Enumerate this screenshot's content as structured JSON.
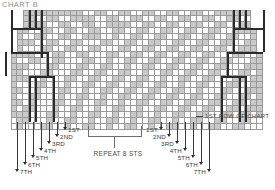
{
  "title": "CHART B",
  "callouts": {
    "first_row": "1ST ROW OF CHART",
    "repeat": "REPEAT 8 STS"
  },
  "row_labels_left": [
    "1ST",
    "2ND",
    "3RD",
    "4TH",
    "5TH",
    "6TH",
    "7TH"
  ],
  "row_labels_right": [
    "1ST",
    "2ND",
    "3RD",
    "4TH",
    "5TH",
    "6TH",
    "7TH"
  ],
  "colors": {
    "grid_line": "#9a9a9a",
    "shaded_cell": "#c9c9c9",
    "empty_cell": "#ffffff",
    "heavy_outline": "#2b2b2b",
    "title": "#8d8d8d",
    "label": "#3a3a3a"
  },
  "chart_data": {
    "type": "heatmap",
    "title": "CHART B",
    "xlabel": "",
    "ylabel": "",
    "cell_size_px": 6,
    "columns": 42,
    "rows": 20,
    "legend": [
      {
        "key": "shaded",
        "color": "#c9c9c9",
        "meaning": "patterned stitch"
      },
      {
        "key": "empty",
        "color": "#ffffff",
        "meaning": "plain stitch"
      }
    ],
    "annotations": [
      {
        "text": "1ST ROW OF CHART",
        "position": "right-bottom"
      },
      {
        "text": "REPEAT 8 STS",
        "position": "bottom-center"
      }
    ],
    "row_extents": [
      {
        "row": 0,
        "start": 2,
        "end": 40
      },
      {
        "row": 1,
        "start": 2,
        "end": 40
      },
      {
        "row": 2,
        "start": 2,
        "end": 40
      },
      {
        "row": 3,
        "start": 1,
        "end": 41
      },
      {
        "row": 4,
        "start": 1,
        "end": 41
      },
      {
        "row": 5,
        "start": 1,
        "end": 41
      },
      {
        "row": 6,
        "start": 1,
        "end": 41
      },
      {
        "row": 7,
        "start": 0,
        "end": 42
      },
      {
        "row": 8,
        "start": 0,
        "end": 42
      },
      {
        "row": 9,
        "start": 0,
        "end": 42
      },
      {
        "row": 10,
        "start": 0,
        "end": 42
      },
      {
        "row": 11,
        "start": 0,
        "end": 42
      },
      {
        "row": 12,
        "start": 0,
        "end": 42
      },
      {
        "row": 13,
        "start": 0,
        "end": 42
      },
      {
        "row": 14,
        "start": 0,
        "end": 42
      },
      {
        "row": 15,
        "start": 0,
        "end": 42
      },
      {
        "row": 16,
        "start": 0,
        "end": 42
      },
      {
        "row": 17,
        "start": 0,
        "end": 42
      },
      {
        "row": 18,
        "start": 0,
        "end": 42
      },
      {
        "row": 19,
        "start": 0,
        "end": 42
      }
    ],
    "shaded_cells": [
      {
        "row": 0,
        "cols": [
          2,
          3,
          4,
          5,
          6,
          7,
          8,
          9,
          10,
          11,
          14,
          15,
          18,
          19,
          22,
          23,
          26,
          27,
          30,
          31,
          34,
          35,
          36,
          37,
          38,
          39
        ]
      },
      {
        "row": 1,
        "cols": [
          2,
          3,
          6,
          7,
          10,
          11,
          12,
          13,
          16,
          17,
          20,
          21,
          24,
          25,
          28,
          29,
          32,
          33,
          36,
          37
        ]
      },
      {
        "row": 2,
        "cols": [
          2,
          3,
          4,
          5,
          8,
          9,
          12,
          13,
          16,
          17,
          18,
          19,
          22,
          23,
          26,
          27,
          30,
          31,
          34,
          35,
          38,
          39
        ]
      },
      {
        "row": 3,
        "cols": [
          1,
          2,
          5,
          6,
          9,
          10,
          13,
          14,
          17,
          18,
          21,
          22,
          25,
          26,
          29,
          30,
          33,
          34,
          37,
          38,
          39,
          40
        ]
      },
      {
        "row": 4,
        "cols": [
          1,
          4,
          5,
          8,
          9,
          12,
          13,
          14,
          17,
          20,
          21,
          24,
          25,
          28,
          29,
          32,
          33,
          36,
          37,
          40
        ]
      },
      {
        "row": 5,
        "cols": [
          1,
          2,
          3,
          6,
          7,
          10,
          11,
          15,
          16,
          19,
          20,
          23,
          24,
          27,
          28,
          31,
          32,
          35,
          36,
          39,
          40
        ]
      },
      {
        "row": 6,
        "cols": [
          1,
          5,
          6,
          9,
          10,
          13,
          14,
          18,
          19,
          22,
          23,
          26,
          27,
          30,
          31,
          34,
          35,
          38,
          39,
          40
        ]
      },
      {
        "row": 7,
        "cols": [
          0,
          1,
          2,
          3,
          7,
          8,
          11,
          12,
          16,
          17,
          20,
          21,
          24,
          25,
          28,
          29,
          32,
          33,
          37,
          38,
          41
        ]
      },
      {
        "row": 8,
        "cols": [
          0,
          3,
          4,
          7,
          8,
          12,
          13,
          16,
          19,
          20,
          23,
          24,
          27,
          28,
          31,
          32,
          35,
          36,
          40,
          41
        ]
      },
      {
        "row": 9,
        "cols": [
          0,
          1,
          2,
          6,
          7,
          11,
          12,
          15,
          16,
          19,
          22,
          23,
          26,
          27,
          30,
          31,
          34,
          35,
          39,
          40,
          41
        ]
      },
      {
        "row": 10,
        "cols": [
          0,
          1,
          5,
          6,
          10,
          11,
          14,
          15,
          18,
          19,
          22,
          25,
          26,
          29,
          30,
          33,
          34,
          38,
          39,
          41
        ]
      },
      {
        "row": 11,
        "cols": [
          0,
          1,
          2,
          5,
          9,
          10,
          13,
          14,
          17,
          18,
          21,
          22,
          25,
          28,
          29,
          32,
          33,
          37,
          38,
          40,
          41
        ]
      },
      {
        "row": 12,
        "cols": [
          0,
          4,
          5,
          9,
          12,
          13,
          16,
          17,
          20,
          21,
          24,
          25,
          28,
          31,
          32,
          36,
          37,
          40,
          41
        ]
      },
      {
        "row": 13,
        "cols": [
          0,
          1,
          4,
          8,
          9,
          12,
          15,
          16,
          19,
          20,
          23,
          24,
          27,
          28,
          31,
          35,
          36,
          39,
          40,
          41
        ]
      },
      {
        "row": 14,
        "cols": [
          0,
          3,
          4,
          8,
          11,
          12,
          15,
          18,
          19,
          22,
          23,
          26,
          27,
          30,
          31,
          34,
          35,
          38,
          39,
          41
        ]
      },
      {
        "row": 15,
        "cols": [
          0,
          1,
          3,
          7,
          8,
          11,
          14,
          15,
          18,
          21,
          22,
          25,
          26,
          29,
          30,
          33,
          34,
          37,
          38,
          40,
          41
        ]
      },
      {
        "row": 16,
        "cols": [
          0,
          2,
          3,
          7,
          10,
          11,
          14,
          17,
          18,
          21,
          24,
          25,
          28,
          29,
          32,
          33,
          36,
          37,
          39,
          40,
          41
        ]
      },
      {
        "row": 17,
        "cols": [
          0,
          1,
          2,
          6,
          7,
          10,
          13,
          14,
          17,
          20,
          21,
          24,
          27,
          28,
          31,
          32,
          35,
          36,
          38,
          39,
          41
        ]
      },
      {
        "row": 18,
        "cols": [
          1,
          2,
          6,
          9,
          10,
          13,
          16,
          17,
          20,
          23,
          24,
          27,
          30,
          31,
          34,
          35,
          38,
          39
        ]
      },
      {
        "row": 19,
        "cols": [
          1,
          5,
          6,
          9,
          12,
          13,
          16,
          19,
          20,
          23,
          26,
          27,
          30,
          33,
          34,
          37,
          38
        ]
      }
    ]
  },
  "grid_geometry": {
    "origin_x": 11,
    "origin_y": 10,
    "cell": 6,
    "rows": 20,
    "cols": 42
  },
  "heavy_outline_segments": [
    {
      "type": "v",
      "x": 11,
      "y": 10,
      "len": 18
    },
    {
      "type": "v",
      "x": 29,
      "y": 10,
      "len": 18
    },
    {
      "type": "v",
      "x": 35,
      "y": 10,
      "len": 18
    },
    {
      "type": "v",
      "x": 41,
      "y": 10,
      "len": 18
    },
    {
      "type": "h",
      "x": 11,
      "y": 28,
      "len": 30
    },
    {
      "type": "v",
      "x": 11,
      "y": 28,
      "len": 24
    },
    {
      "type": "v",
      "x": 41,
      "y": 28,
      "len": 24
    },
    {
      "type": "h",
      "x": 11,
      "y": 52,
      "len": 36
    },
    {
      "type": "v",
      "x": 41,
      "y": 52,
      "len": 6
    },
    {
      "type": "v",
      "x": 47,
      "y": 52,
      "len": 24
    },
    {
      "type": "v",
      "x": 5,
      "y": 52,
      "len": 24
    },
    {
      "type": "h",
      "x": 29,
      "y": 76,
      "len": 24
    },
    {
      "type": "v",
      "x": 53,
      "y": 76,
      "len": 46
    },
    {
      "type": "v",
      "x": 29,
      "y": 76,
      "len": 46
    },
    {
      "type": "v",
      "x": 35,
      "y": 76,
      "len": 46
    },
    {
      "type": "v",
      "x": 233,
      "y": 10,
      "len": 18
    },
    {
      "type": "v",
      "x": 239,
      "y": 10,
      "len": 18
    },
    {
      "type": "v",
      "x": 245,
      "y": 10,
      "len": 18
    },
    {
      "type": "v",
      "x": 263,
      "y": 10,
      "len": 18
    },
    {
      "type": "h",
      "x": 233,
      "y": 28,
      "len": 30
    },
    {
      "type": "v",
      "x": 233,
      "y": 28,
      "len": 24
    },
    {
      "type": "v",
      "x": 263,
      "y": 28,
      "len": 24
    },
    {
      "type": "h",
      "x": 227,
      "y": 52,
      "len": 36
    },
    {
      "type": "v",
      "x": 227,
      "y": 52,
      "len": 24
    },
    {
      "type": "h",
      "x": 221,
      "y": 76,
      "len": 24
    },
    {
      "type": "v",
      "x": 221,
      "y": 76,
      "len": 46
    },
    {
      "type": "v",
      "x": 239,
      "y": 76,
      "len": 46
    },
    {
      "type": "v",
      "x": 245,
      "y": 76,
      "len": 46
    }
  ],
  "left_pointers": [
    {
      "label": "1ST",
      "x": 65,
      "arrow_y": 127,
      "label_x": 68,
      "label_y": 126
    },
    {
      "label": "2ND",
      "x": 57,
      "arrow_y": 134,
      "label_x": 60,
      "label_y": 133
    },
    {
      "label": "3RD",
      "x": 49,
      "arrow_y": 141,
      "label_x": 52,
      "label_y": 140
    },
    {
      "label": "4TH",
      "x": 41,
      "arrow_y": 148,
      "label_x": 44,
      "label_y": 147
    },
    {
      "label": "5TH",
      "x": 33,
      "arrow_y": 155,
      "label_x": 36,
      "label_y": 154
    },
    {
      "label": "6TH",
      "x": 25,
      "arrow_y": 162,
      "label_x": 28,
      "label_y": 161
    },
    {
      "label": "7TH",
      "x": 17,
      "arrow_y": 169,
      "label_x": 20,
      "label_y": 168
    }
  ],
  "right_pointers": [
    {
      "label": "1ST",
      "x": 161,
      "arrow_y": 127,
      "label_x": 136,
      "label_y": 126
    },
    {
      "label": "2ND",
      "x": 169,
      "arrow_y": 134,
      "label_x": 144,
      "label_y": 133
    },
    {
      "label": "3RD",
      "x": 177,
      "arrow_y": 141,
      "label_x": 152,
      "label_y": 140
    },
    {
      "label": "4TH",
      "x": 185,
      "arrow_y": 148,
      "label_x": 160,
      "label_y": 147
    },
    {
      "label": "5TH",
      "x": 193,
      "arrow_y": 155,
      "label_x": 168,
      "label_y": 154
    },
    {
      "label": "6TH",
      "x": 201,
      "arrow_y": 162,
      "label_x": 176,
      "label_y": 161
    },
    {
      "label": "7TH",
      "x": 209,
      "arrow_y": 169,
      "label_x": 184,
      "label_y": 168
    }
  ]
}
